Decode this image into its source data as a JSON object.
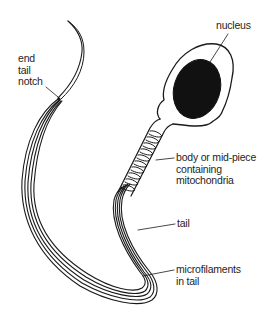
{
  "diagram": {
    "labels": {
      "end_tail_notch": "end\ntail\nnotch",
      "nucleus": "nucleus",
      "mid_piece": "body or mid-piece\ncontaining\nmitochondria",
      "tail": "tail",
      "microfilaments": "microfilaments\nin tail"
    },
    "colors": {
      "line": "#1a1a1a",
      "nucleus_fill": "#111111",
      "background": "#ffffff"
    }
  }
}
